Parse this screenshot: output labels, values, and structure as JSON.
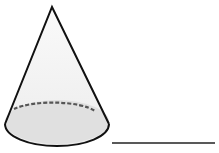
{
  "figure": {
    "shape": "cone",
    "answer_line": "blank",
    "colors": {
      "stroke": "#111111",
      "fill_side": "#f4f4f4",
      "fill_base": "#e2e2e2",
      "dashed": "#555555"
    }
  }
}
